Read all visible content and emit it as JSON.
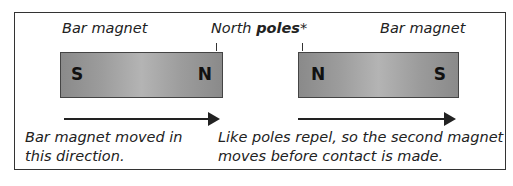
{
  "diagram": {
    "left_magnet": {
      "label": "Bar magnet",
      "pole_left": "S",
      "pole_right": "N"
    },
    "right_magnet": {
      "label": "Bar magnet",
      "pole_left": "N",
      "pole_right": "S"
    },
    "north_label": {
      "prefix": "North ",
      "bold": "poles",
      "suffix": "*"
    },
    "captions": {
      "left_line1": "Bar magnet moved in",
      "left_line2": "this direction.",
      "right_line1": "Like poles repel, so the second magnet",
      "right_line2": "moves before contact is made."
    },
    "colors": {
      "magnet": "#9c9c9c",
      "border": "#333333",
      "text": "#222222"
    }
  }
}
